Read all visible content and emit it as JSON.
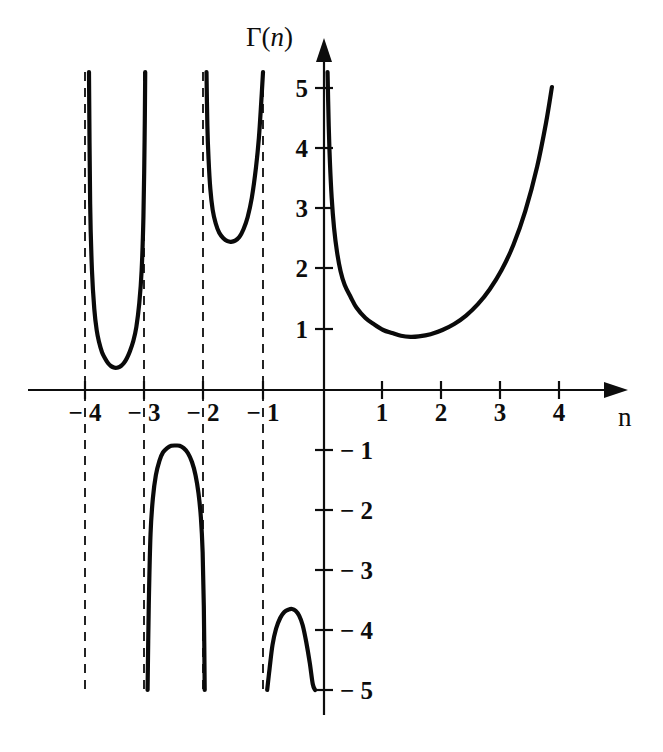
{
  "figure": {
    "title": "",
    "y_axis_label": "Γ(n)",
    "x_axis_label": "n"
  },
  "axes": {
    "y_label_gamma": "Γ(",
    "y_label_var": "n",
    "y_label_close": ")",
    "x_label_var": "n"
  },
  "ticks": {
    "x_labels": [
      "− 4",
      "− 3",
      "− 2",
      "− 1",
      "1",
      "2",
      "3",
      "4"
    ],
    "y_labels": [
      "5",
      "4",
      "3",
      "2",
      "1",
      "− 1",
      "− 2",
      "− 3",
      "− 4",
      "− 5"
    ]
  },
  "chart_data": {
    "type": "line",
    "title": "",
    "xlabel": "n",
    "ylabel": "Γ(n)",
    "xlim": [
      -4.2,
      4.1
    ],
    "ylim": [
      -5.3,
      5.3
    ],
    "grid": false,
    "legend": null,
    "x_ticks": [
      -4,
      -3,
      -2,
      -1,
      1,
      2,
      3,
      4
    ],
    "x_tick_labels": [
      "− 4",
      "− 3",
      "− 2",
      "− 1",
      "1",
      "2",
      "3",
      "4"
    ],
    "y_ticks": [
      5,
      4,
      3,
      2,
      1,
      -1,
      -2,
      -3,
      -4,
      -5
    ],
    "y_tick_labels": [
      "5",
      "4",
      "3",
      "2",
      "1",
      "− 1",
      "− 2",
      "− 3",
      "− 4",
      "− 5"
    ],
    "asymptotes": [
      -4,
      -3,
      -2,
      -1
    ],
    "asymptote_style": "dashed",
    "function": "Gamma(n)",
    "series": [
      {
        "name": "branch-(-4,-3)",
        "domain": [
          -3.99,
          -3.01
        ],
        "sign": "positive",
        "minimum": {
          "x": -3.52,
          "y": 0.37
        },
        "points": [
          [
            -3.97,
            5.3
          ],
          [
            -3.95,
            3.1
          ],
          [
            -3.92,
            2.0
          ],
          [
            -3.88,
            1.35
          ],
          [
            -3.84,
            1.0
          ],
          [
            -3.8,
            0.8
          ],
          [
            -3.75,
            0.63
          ],
          [
            -3.7,
            0.53
          ],
          [
            -3.65,
            0.45
          ],
          [
            -3.6,
            0.4
          ],
          [
            -3.55,
            0.375
          ],
          [
            -3.52,
            0.37
          ],
          [
            -3.48,
            0.375
          ],
          [
            -3.43,
            0.4
          ],
          [
            -3.38,
            0.45
          ],
          [
            -3.33,
            0.53
          ],
          [
            -3.28,
            0.64
          ],
          [
            -3.22,
            0.82
          ],
          [
            -3.17,
            1.05
          ],
          [
            -3.12,
            1.45
          ],
          [
            -3.08,
            2.0
          ],
          [
            -3.05,
            2.9
          ],
          [
            -3.03,
            4.2
          ],
          [
            -3.02,
            5.3
          ]
        ]
      },
      {
        "name": "branch-(-3,-2)",
        "domain": [
          -2.99,
          -2.01
        ],
        "sign": "negative",
        "maximum": {
          "x": -2.46,
          "y": -0.93
        },
        "points": [
          [
            -2.98,
            -5.3
          ],
          [
            -2.96,
            -3.6
          ],
          [
            -2.93,
            -2.4
          ],
          [
            -2.89,
            -1.8
          ],
          [
            -2.84,
            -1.42
          ],
          [
            -2.78,
            -1.18
          ],
          [
            -2.72,
            -1.04
          ],
          [
            -2.65,
            -0.97
          ],
          [
            -2.58,
            -0.93
          ],
          [
            -2.5,
            -0.925
          ],
          [
            -2.44,
            -0.93
          ],
          [
            -2.37,
            -0.97
          ],
          [
            -2.3,
            -1.05
          ],
          [
            -2.23,
            -1.2
          ],
          [
            -2.17,
            -1.42
          ],
          [
            -2.12,
            -1.72
          ],
          [
            -2.08,
            -2.12
          ],
          [
            -2.05,
            -2.7
          ],
          [
            -2.03,
            -3.6
          ],
          [
            -2.015,
            -5.3
          ]
        ]
      },
      {
        "name": "branch-(-2,-1)",
        "domain": [
          -1.99,
          -1.01
        ],
        "sign": "positive",
        "minimum": {
          "x": -1.57,
          "y": 2.47
        },
        "points": [
          [
            -1.985,
            5.3
          ],
          [
            -1.97,
            4.4
          ],
          [
            -1.95,
            3.85
          ],
          [
            -1.92,
            3.35
          ],
          [
            -1.88,
            3.0
          ],
          [
            -1.83,
            2.78
          ],
          [
            -1.77,
            2.62
          ],
          [
            -1.7,
            2.53
          ],
          [
            -1.63,
            2.48
          ],
          [
            -1.57,
            2.47
          ],
          [
            -1.5,
            2.49
          ],
          [
            -1.43,
            2.55
          ],
          [
            -1.36,
            2.68
          ],
          [
            -1.29,
            2.88
          ],
          [
            -1.22,
            3.2
          ],
          [
            -1.15,
            3.7
          ],
          [
            -1.1,
            4.2
          ],
          [
            -1.06,
            4.8
          ],
          [
            -1.03,
            5.3
          ]
        ]
      },
      {
        "name": "branch-(-1,0)",
        "domain": [
          -0.99,
          -0.02
        ],
        "sign": "negative",
        "maximum": {
          "x": -0.54,
          "y": -3.65
        },
        "points": [
          [
            -0.96,
            -5.3
          ],
          [
            -0.92,
            -4.65
          ],
          [
            -0.87,
            -4.25
          ],
          [
            -0.81,
            -3.98
          ],
          [
            -0.74,
            -3.8
          ],
          [
            -0.67,
            -3.7
          ],
          [
            -0.6,
            -3.66
          ],
          [
            -0.54,
            -3.65
          ],
          [
            -0.48,
            -3.68
          ],
          [
            -0.42,
            -3.76
          ],
          [
            -0.36,
            -3.92
          ],
          [
            -0.3,
            -4.2
          ],
          [
            -0.24,
            -4.55
          ],
          [
            -0.19,
            -4.9
          ],
          [
            -0.15,
            -5.3
          ]
        ]
      },
      {
        "name": "branch-(0,inf)",
        "domain": [
          0.02,
          3.85
        ],
        "sign": "positive",
        "minimum": {
          "x": 1.46,
          "y": 0.89
        },
        "points": [
          [
            0.06,
            5.3
          ],
          [
            0.08,
            4.4
          ],
          [
            0.1,
            3.8
          ],
          [
            0.13,
            3.2
          ],
          [
            0.17,
            2.7
          ],
          [
            0.22,
            2.3
          ],
          [
            0.28,
            1.98
          ],
          [
            0.35,
            1.75
          ],
          [
            0.45,
            1.55
          ],
          [
            0.55,
            1.37
          ],
          [
            0.7,
            1.2
          ],
          [
            0.85,
            1.09
          ],
          [
            1.0,
            1.0
          ],
          [
            1.15,
            0.95
          ],
          [
            1.3,
            0.905
          ],
          [
            1.46,
            0.886
          ],
          [
            1.6,
            0.894
          ],
          [
            1.8,
            0.93
          ],
          [
            2.0,
            1.0
          ],
          [
            2.2,
            1.1
          ],
          [
            2.4,
            1.24
          ],
          [
            2.6,
            1.43
          ],
          [
            2.8,
            1.68
          ],
          [
            3.0,
            2.0
          ],
          [
            3.2,
            2.42
          ],
          [
            3.4,
            2.98
          ],
          [
            3.6,
            3.72
          ],
          [
            3.75,
            4.45
          ],
          [
            3.85,
            5.05
          ]
        ]
      }
    ]
  }
}
